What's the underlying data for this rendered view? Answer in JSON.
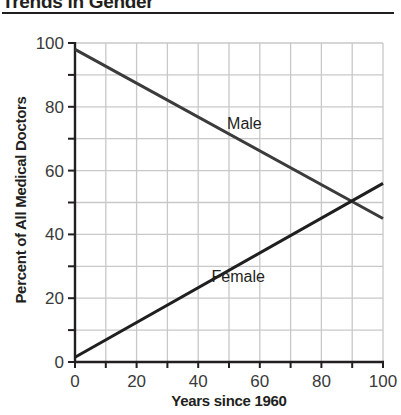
{
  "chart_data": {
    "type": "line",
    "title": "Trends in Gender",
    "xlabel": "Years since 1960",
    "ylabel": "Percent of All Medical Doctors",
    "xlim": [
      0,
      100
    ],
    "ylim": [
      0,
      100
    ],
    "x_ticks": [
      0,
      20,
      40,
      60,
      80,
      100
    ],
    "y_ticks": [
      0,
      20,
      40,
      60,
      80,
      100
    ],
    "x_minor_step": 10,
    "y_minor_step": 10,
    "grid": true,
    "legend": "inline labels",
    "series": [
      {
        "name": "Male",
        "x": [
          0,
          100
        ],
        "y": [
          98,
          45
        ],
        "color": "#3b3b3b"
      },
      {
        "name": "Female",
        "x": [
          0,
          100
        ],
        "y": [
          1.5,
          56
        ],
        "color": "#1f1f1f"
      }
    ],
    "annotations": [
      {
        "text": "Male",
        "x": 55,
        "y": 73
      },
      {
        "text": "Female",
        "x": 53,
        "y": 25
      }
    ],
    "intersection": {
      "x": 89,
      "y": 50
    }
  },
  "colors": {
    "axis": "#231f20",
    "grid": "#c8c8c8",
    "text": "#231f20"
  }
}
